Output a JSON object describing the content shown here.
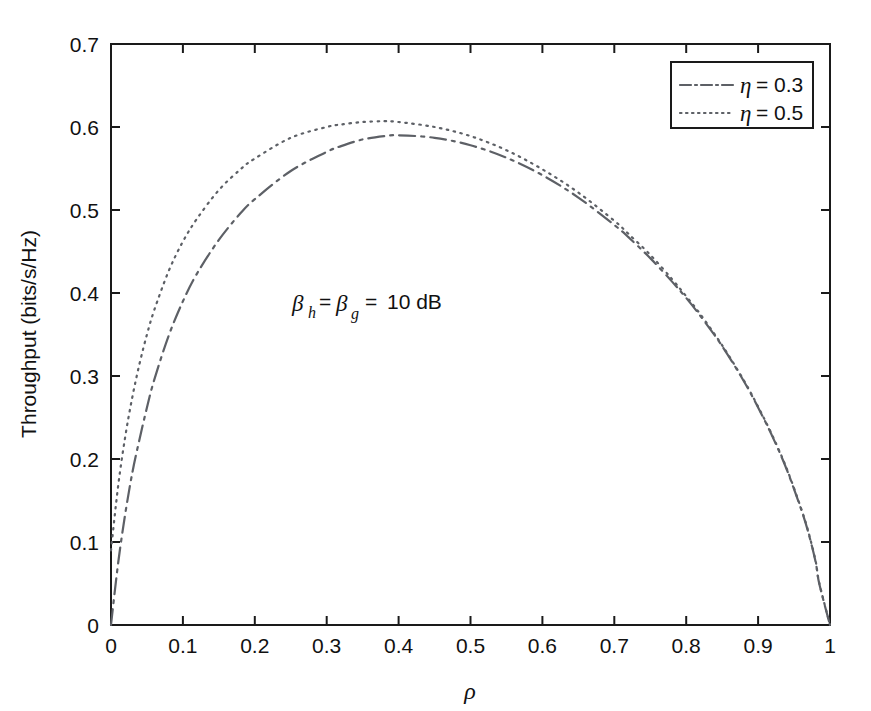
{
  "chart_data": {
    "type": "line",
    "title": "",
    "xlabel": "ρ",
    "ylabel": "Throughput (bits/s/Hz)",
    "xlim": [
      0,
      1
    ],
    "ylim": [
      0,
      0.7
    ],
    "grid": false,
    "xticks": [
      "0",
      "0.1",
      "0.2",
      "0.3",
      "0.4",
      "0.5",
      "0.6",
      "0.7",
      "0.8",
      "0.9",
      "1"
    ],
    "xtick_values": [
      0,
      0.1,
      0.2,
      0.3,
      0.4,
      0.5,
      0.6,
      0.7,
      0.8,
      0.9,
      1
    ],
    "yticks": [
      "0",
      "0.1",
      "0.2",
      "0.3",
      "0.4",
      "0.5",
      "0.6",
      "0.7"
    ],
    "ytick_values": [
      0,
      0.1,
      0.2,
      0.3,
      0.4,
      0.5,
      0.6,
      0.7
    ],
    "legend_position": "upper right",
    "x": [
      0.0,
      0.01,
      0.02,
      0.03,
      0.04,
      0.05,
      0.06,
      0.08,
      0.1,
      0.12,
      0.15,
      0.18,
      0.2,
      0.25,
      0.3,
      0.32,
      0.35,
      0.38,
      0.4,
      0.45,
      0.5,
      0.55,
      0.6,
      0.65,
      0.7,
      0.72,
      0.75,
      0.78,
      0.8,
      0.82,
      0.85,
      0.88,
      0.9,
      0.92,
      0.94,
      0.96,
      0.97,
      0.98,
      0.985,
      1.0
    ],
    "series": [
      {
        "name": "η = 0.3",
        "label": "η = 0.3",
        "linestyle": "dashdot",
        "color": "#5d6066",
        "values": [
          0.0,
          0.075,
          0.135,
          0.185,
          0.225,
          0.262,
          0.295,
          0.348,
          0.39,
          0.424,
          0.464,
          0.496,
          0.513,
          0.547,
          0.57,
          0.577,
          0.585,
          0.589,
          0.59,
          0.587,
          0.578,
          0.563,
          0.542,
          0.515,
          0.482,
          0.467,
          0.442,
          0.414,
          0.394,
          0.372,
          0.336,
          0.294,
          0.262,
          0.227,
          0.187,
          0.139,
          0.111,
          0.076,
          0.05,
          0.0
        ]
      },
      {
        "name": "η = 0.5",
        "label": "η = 0.5",
        "linestyle": "dotted",
        "color": "#5d6066",
        "values": [
          0.09,
          0.168,
          0.228,
          0.276,
          0.316,
          0.35,
          0.379,
          0.426,
          0.462,
          0.49,
          0.524,
          0.549,
          0.562,
          0.587,
          0.6,
          0.603,
          0.606,
          0.607,
          0.606,
          0.6,
          0.589,
          0.572,
          0.549,
          0.521,
          0.487,
          0.471,
          0.446,
          0.417,
          0.396,
          0.374,
          0.337,
          0.295,
          0.263,
          0.228,
          0.188,
          0.14,
          0.112,
          0.077,
          0.051,
          0.0
        ]
      }
    ],
    "annotations": [
      {
        "name": "beta-annotation",
        "text": "β_h = β_g = 10 dB",
        "parts": {
          "beta1": "β",
          "sub1": "h",
          "eq1": "=",
          "beta2": "β",
          "sub2": "g",
          "eq2": "=",
          "value": "10 dB"
        },
        "x": 0.27,
        "y": 0.4
      }
    ]
  },
  "colors": {
    "axis": "#1a1a1a",
    "curve": "#5d6066",
    "background": "#ffffff"
  }
}
